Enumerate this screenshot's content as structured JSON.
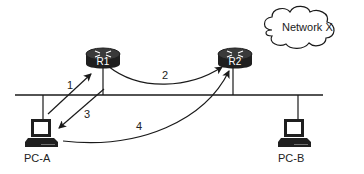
{
  "diagram": {
    "type": "network-topology",
    "nodes": {
      "r1": {
        "label": "R1",
        "kind": "router"
      },
      "r2": {
        "label": "R2",
        "kind": "router"
      },
      "pc_a": {
        "label": "PC-A",
        "kind": "pc"
      },
      "pc_b": {
        "label": "PC-B",
        "kind": "pc"
      },
      "cloud": {
        "label": "Network X",
        "kind": "cloud"
      }
    },
    "segments": [
      {
        "name": "lan-bus",
        "connects": [
          "R1",
          "R2",
          "PC-A",
          "PC-B"
        ]
      }
    ],
    "flows": [
      {
        "label": "1",
        "from": "PC-A",
        "to": "R1"
      },
      {
        "label": "2",
        "from": "R1",
        "to": "R2"
      },
      {
        "label": "3",
        "from": "R1",
        "to": "PC-A"
      },
      {
        "label": "4",
        "from": "PC-A",
        "to": "R2"
      }
    ],
    "colors": {
      "line": "#1a1a1a",
      "router_body": "#1f1f1f",
      "router_top": "#3a3a3a",
      "background": "#ffffff"
    }
  }
}
